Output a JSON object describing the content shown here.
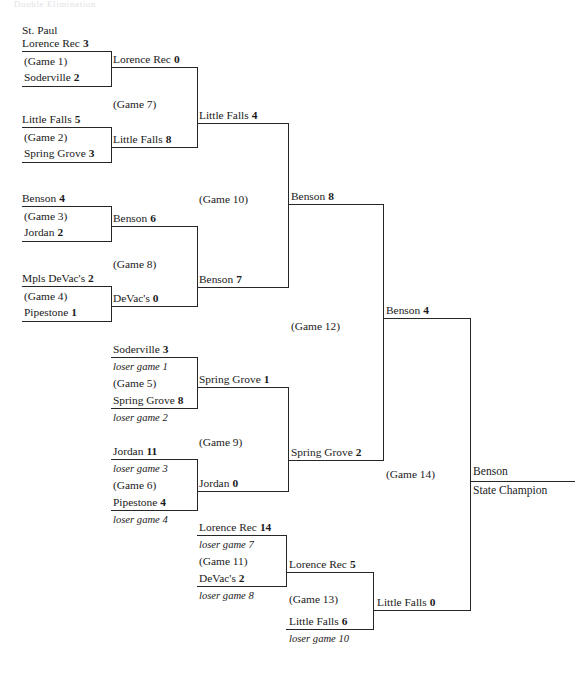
{
  "header": {
    "title": "Double Elimination"
  },
  "champion": {
    "team": "Benson",
    "title": "State Champion"
  },
  "winners_bracket": {
    "round1": [
      {
        "city": "St. Paul",
        "top_team": "Lorence Rec",
        "top_score": "3",
        "game": "(Game 1)",
        "bottom_team": "Soderville",
        "bottom_score": "2"
      },
      {
        "city": "",
        "top_team": "Little Falls",
        "top_score": "5",
        "game": "(Game 2)",
        "bottom_team": "Spring Grove",
        "bottom_score": "3"
      },
      {
        "city": "",
        "top_team": "Benson",
        "top_score": "4",
        "game": "(Game 3)",
        "bottom_team": "Jordan",
        "bottom_score": "2"
      },
      {
        "city": "",
        "top_team": "Mpls DeVac's",
        "top_score": "2",
        "game": "(Game 4)",
        "bottom_team": "Pipestone",
        "bottom_score": "1"
      }
    ],
    "round2": [
      {
        "top_team": "Lorence Rec",
        "top_score": "0",
        "game": "(Game 7)",
        "bottom_team": "Little Falls",
        "bottom_score": "8"
      },
      {
        "top_team": "Benson",
        "top_score": "6",
        "game": "(Game 8)",
        "bottom_team": "DeVac's",
        "bottom_score": "0"
      }
    ],
    "round3": [
      {
        "top_team": "Little Falls",
        "top_score": "4",
        "game": "(Game 10)",
        "bottom_team": "Benson",
        "bottom_score": "7"
      }
    ],
    "round4": [
      {
        "top_team": "Benson",
        "top_score": "8",
        "game": "(Game 12)",
        "bottom_team": "Spring Grove",
        "bottom_score": "2"
      }
    ],
    "final": [
      {
        "top_team": "Benson",
        "top_score": "4",
        "game": "(Game 14)",
        "bottom_team": "Little Falls",
        "bottom_score": "0"
      }
    ]
  },
  "losers_bracket": {
    "round1": [
      {
        "top_team": "Soderville",
        "top_score": "3",
        "top_note": "loser game 1",
        "game": "(Game 5)",
        "bottom_team": "Spring Grove",
        "bottom_score": "8",
        "bottom_note": "loser game 2"
      },
      {
        "top_team": "Jordan",
        "top_score": "11",
        "top_note": "loser game 3",
        "game": "(Game 6)",
        "bottom_team": "Pipestone",
        "bottom_score": "4",
        "bottom_note": "loser game 4"
      },
      {
        "top_team": "Lorence Rec",
        "top_score": "14",
        "top_note": "loser game 7",
        "game": "(Game 11)",
        "bottom_team": "DeVac's",
        "bottom_score": "2",
        "bottom_note": "loser game 8"
      }
    ],
    "round2": [
      {
        "top_team": "Spring Grove",
        "top_score": "1",
        "game": "(Game 9)",
        "bottom_team": "Jordan",
        "bottom_score": "0"
      },
      {
        "top_team": "Lorence Rec",
        "top_score": "5",
        "game": "(Game 13)",
        "bottom_team": "Little Falls",
        "bottom_score": "6",
        "bottom_note": "loser game 10"
      }
    ]
  },
  "colors": {
    "line": "#262626",
    "text": "#1a1a1a",
    "background": "#ffffff"
  }
}
